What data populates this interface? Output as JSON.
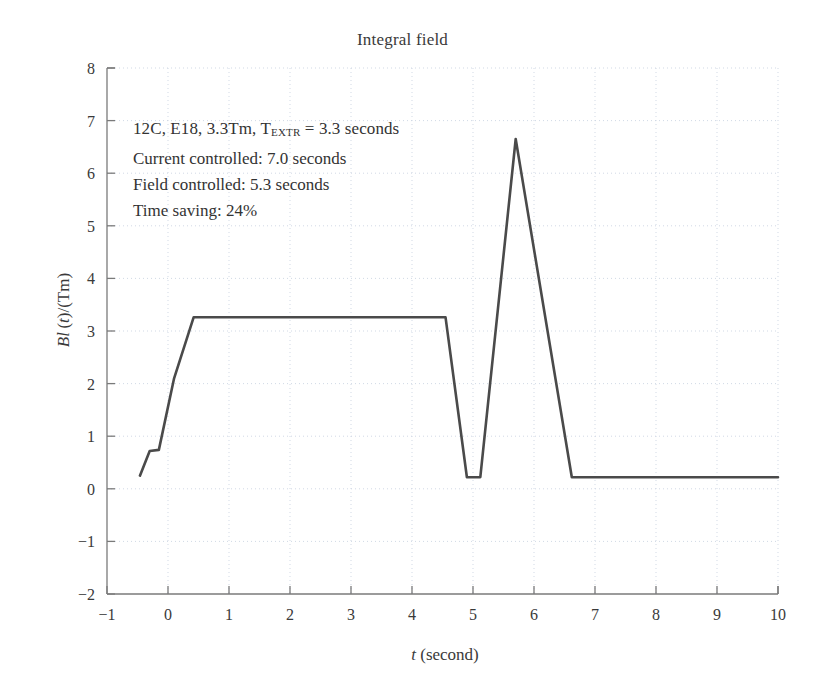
{
  "chart_data": {
    "type": "line",
    "title": "Integral field",
    "xlabel_plain": "t (second)",
    "ylabel_plain": "Bl(t)/(Tm)",
    "xlabel_italic": "t",
    "xlabel_rest": " (second)",
    "xlim": [
      -1,
      10
    ],
    "ylim": [
      -2,
      8
    ],
    "xticks": [
      -1,
      0,
      1,
      2,
      3,
      4,
      5,
      6,
      7,
      8,
      9,
      10
    ],
    "xtick_labels": [
      "−1",
      "0",
      "1",
      "2",
      "3",
      "4",
      "5",
      "6",
      "7",
      "8",
      "9",
      "10"
    ],
    "yticks": [
      -2,
      -1,
      0,
      1,
      2,
      3,
      4,
      5,
      6,
      7,
      8
    ],
    "ytick_labels": [
      "−2",
      "−1",
      "0",
      "1",
      "2",
      "3",
      "4",
      "5",
      "6",
      "7",
      "8"
    ],
    "grid": true,
    "grid_style": "dotted",
    "grid_color": "#c9d2e0",
    "legend": "none",
    "line_color": "#4a4a4a",
    "line_width": 2.6,
    "series": [
      {
        "name": "Bl(t)",
        "x": [
          -0.46,
          -0.3,
          -0.15,
          0.1,
          0.42,
          4.55,
          4.9,
          5.12,
          5.7,
          6.62,
          10.0
        ],
        "y": [
          0.25,
          0.72,
          0.74,
          2.1,
          3.26,
          3.26,
          0.22,
          0.22,
          6.65,
          0.22,
          0.22
        ]
      }
    ],
    "annotations": {
      "line1_pre": "12C, E18, 3.3Tm, T",
      "line1_sub": "EXTR",
      "line1_post": " = 3.3 seconds",
      "line2": "Current controlled: 7.0 seconds",
      "line3": "Field controlled: 5.3 seconds",
      "line4": "Time saving: 24%"
    },
    "key_values": {
      "flat_top_field": 3.26,
      "peak_field": 6.65,
      "peak_time": 5.7,
      "baseline_field": 0.22,
      "extraction_time_s": 3.3,
      "current_controlled_s": 7.0,
      "field_controlled_s": 5.3,
      "time_saving_percent": 24
    }
  }
}
